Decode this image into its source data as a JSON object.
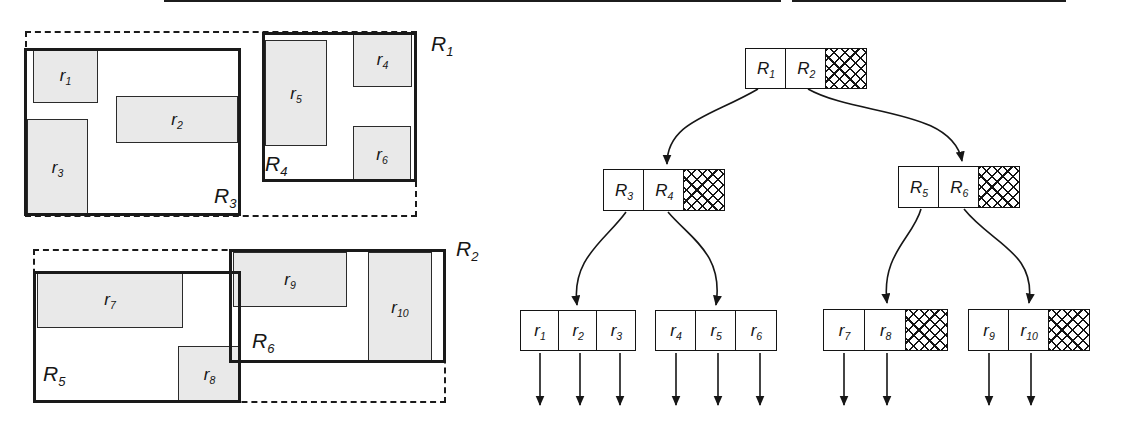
{
  "colors": {
    "ink": "#1a1a1a",
    "object_fill": "#e9e9e9",
    "background": "#ffffff"
  },
  "spatial": {
    "dashed_regions": [
      {
        "name": "R1",
        "base": "R",
        "sub": "1",
        "x": 25,
        "y": 31,
        "w": 392,
        "h": 186,
        "label_x": 431,
        "label_y": 33
      },
      {
        "name": "R2",
        "base": "R",
        "sub": "2",
        "x": 33,
        "y": 249,
        "w": 413,
        "h": 154,
        "label_x": 456,
        "label_y": 238
      }
    ],
    "solid_regions": [
      {
        "name": "R3",
        "base": "R",
        "sub": "3",
        "x": 24,
        "y": 48,
        "w": 217,
        "h": 168,
        "label_x": 214,
        "label_y": 185
      },
      {
        "name": "R4",
        "base": "R",
        "sub": "4",
        "x": 262,
        "y": 32,
        "w": 155,
        "h": 150,
        "label_x": 265,
        "label_y": 153
      },
      {
        "name": "R5",
        "base": "R",
        "sub": "5",
        "x": 33,
        "y": 271,
        "w": 208,
        "h": 132,
        "label_x": 43,
        "label_y": 363
      },
      {
        "name": "R6",
        "base": "R",
        "sub": "6",
        "x": 229,
        "y": 249,
        "w": 217,
        "h": 114,
        "label_x": 252,
        "label_y": 330
      }
    ],
    "objects": [
      {
        "name": "r1",
        "base": "r",
        "sub": "1",
        "x": 33,
        "y": 48,
        "w": 65,
        "h": 55
      },
      {
        "name": "r2",
        "base": "r",
        "sub": "2",
        "x": 116,
        "y": 96,
        "w": 122,
        "h": 47
      },
      {
        "name": "r3",
        "base": "r",
        "sub": "3",
        "x": 27,
        "y": 119,
        "w": 61,
        "h": 97
      },
      {
        "name": "r4",
        "base": "r",
        "sub": "4",
        "x": 353,
        "y": 32,
        "w": 59,
        "h": 55
      },
      {
        "name": "r5",
        "base": "r",
        "sub": "5",
        "x": 265,
        "y": 40,
        "w": 62,
        "h": 106
      },
      {
        "name": "r6",
        "base": "r",
        "sub": "6",
        "x": 353,
        "y": 126,
        "w": 58,
        "h": 56
      },
      {
        "name": "r7",
        "base": "r",
        "sub": "7",
        "x": 37,
        "y": 271,
        "w": 146,
        "h": 57
      },
      {
        "name": "r8",
        "base": "r",
        "sub": "8",
        "x": 178,
        "y": 346,
        "w": 63,
        "h": 57
      },
      {
        "name": "r9",
        "base": "r",
        "sub": "9",
        "x": 233,
        "y": 252,
        "w": 114,
        "h": 55
      },
      {
        "name": "r10",
        "base": "r",
        "sub": "10",
        "x": 368,
        "y": 252,
        "w": 64,
        "h": 111
      }
    ]
  },
  "tree": {
    "nodes": [
      {
        "name": "node-root",
        "x": 745,
        "y": 48,
        "cell_w": 42,
        "cell_h": 41,
        "cells": [
          {
            "base": "R",
            "sub": "1"
          },
          {
            "base": "R",
            "sub": "2"
          },
          {
            "hatched": true
          }
        ]
      },
      {
        "name": "node-r3r4",
        "x": 603,
        "y": 169,
        "cell_w": 42,
        "cell_h": 42,
        "cells": [
          {
            "base": "R",
            "sub": "3"
          },
          {
            "base": "R",
            "sub": "4"
          },
          {
            "hatched": true
          }
        ]
      },
      {
        "name": "node-r5r6",
        "x": 898,
        "y": 166,
        "cell_w": 42,
        "cell_h": 42,
        "cells": [
          {
            "base": "R",
            "sub": "5"
          },
          {
            "base": "R",
            "sub": "6"
          },
          {
            "hatched": true
          }
        ]
      },
      {
        "name": "leaf-r1r2r3",
        "x": 520,
        "y": 310,
        "cell_w": 40,
        "cell_h": 41,
        "cells": [
          {
            "base": "r",
            "sub": "1"
          },
          {
            "base": "r",
            "sub": "2"
          },
          {
            "base": "r",
            "sub": "3"
          }
        ]
      },
      {
        "name": "leaf-r4r5r6",
        "x": 655,
        "y": 310,
        "cell_w": 42,
        "cell_h": 41,
        "cells": [
          {
            "base": "r",
            "sub": "4"
          },
          {
            "base": "r",
            "sub": "5"
          },
          {
            "base": "r",
            "sub": "6"
          }
        ]
      },
      {
        "name": "leaf-r7r8",
        "x": 823,
        "y": 309,
        "cell_w": 43,
        "cell_h": 42,
        "cells": [
          {
            "base": "r",
            "sub": "7"
          },
          {
            "base": "r",
            "sub": "8"
          },
          {
            "hatched": true
          }
        ]
      },
      {
        "name": "leaf-r9r10",
        "x": 968,
        "y": 309,
        "cell_w": 42,
        "cell_h": 42,
        "cells": [
          {
            "base": "r",
            "sub": "9"
          },
          {
            "base": "r",
            "sub": "10"
          },
          {
            "hatched": true
          }
        ]
      }
    ],
    "edges": [
      {
        "name": "edge-root-R1-to-node-r3r4",
        "d": "M758,89 C712,116 667,122 667,164"
      },
      {
        "name": "edge-root-R2-to-node-r5r6",
        "d": "M808,89 C856,116 952,108 962,161"
      },
      {
        "name": "edge-R3-to-leaf-r1r2r3",
        "d": "M626,212 C606,240 571,258 577,305"
      },
      {
        "name": "edge-R4-to-leaf-r4r5r6",
        "d": "M668,212 C690,238 724,254 716,305"
      },
      {
        "name": "edge-R5-to-leaf-r7r8",
        "d": "M921,209 C913,238 881,254 887,303"
      },
      {
        "name": "edge-R6-to-leaf-r9r10",
        "d": "M964,209 C992,244 1036,252 1029,303"
      }
    ],
    "record_arrows": [
      {
        "x": 540,
        "y1": 353,
        "y2": 405
      },
      {
        "x": 580,
        "y1": 353,
        "y2": 405
      },
      {
        "x": 620,
        "y1": 353,
        "y2": 405
      },
      {
        "x": 676,
        "y1": 353,
        "y2": 405
      },
      {
        "x": 718,
        "y1": 353,
        "y2": 405
      },
      {
        "x": 760,
        "y1": 353,
        "y2": 405
      },
      {
        "x": 844,
        "y1": 353,
        "y2": 405
      },
      {
        "x": 887,
        "y1": 353,
        "y2": 405
      },
      {
        "x": 989,
        "y1": 353,
        "y2": 405
      },
      {
        "x": 1031,
        "y1": 353,
        "y2": 405
      }
    ]
  },
  "artifacts": {
    "top_crop_segments": [
      {
        "x": 164,
        "w": 617
      },
      {
        "x": 792,
        "w": 274
      }
    ]
  }
}
